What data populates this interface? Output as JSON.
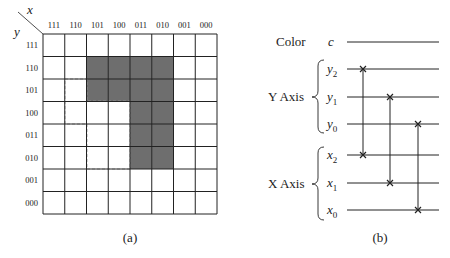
{
  "panel_a": {
    "caption": "(a)",
    "corner_x_label": "x",
    "corner_y_label": "y",
    "columns": [
      "111",
      "110",
      "101",
      "100",
      "011",
      "010",
      "001",
      "000"
    ],
    "rows": [
      "111",
      "110",
      "101",
      "100",
      "011",
      "010",
      "001",
      "000"
    ],
    "shaded_cells": [
      [
        1,
        2
      ],
      [
        1,
        3
      ],
      [
        1,
        4
      ],
      [
        1,
        5
      ],
      [
        2,
        2
      ],
      [
        2,
        3
      ],
      [
        2,
        4
      ],
      [
        2,
        5
      ],
      [
        3,
        4
      ],
      [
        3,
        5
      ],
      [
        4,
        4
      ],
      [
        4,
        5
      ],
      [
        5,
        4
      ],
      [
        5,
        5
      ]
    ],
    "shade_color": "#6e6e6e",
    "grid_color": "#222222"
  },
  "panel_b": {
    "caption": "(b)",
    "color_label": "Color",
    "color_var": "c",
    "y_axis_label": "Y Axis",
    "x_axis_label": "X Axis",
    "wires": [
      {
        "name": "y",
        "sub": "2"
      },
      {
        "name": "y",
        "sub": "1"
      },
      {
        "name": "y",
        "sub": "0"
      },
      {
        "name": "x",
        "sub": "2"
      },
      {
        "name": "x",
        "sub": "1"
      },
      {
        "name": "x",
        "sub": "0"
      }
    ],
    "swaps": [
      {
        "from": "y2",
        "to": "x2"
      },
      {
        "from": "y1",
        "to": "x1"
      },
      {
        "from": "y0",
        "to": "x0"
      }
    ],
    "swap_marker": "×"
  }
}
